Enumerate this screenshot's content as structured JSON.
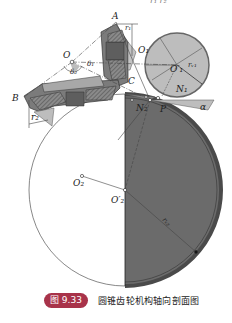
{
  "figure": {
    "type": "bevel-gear-axial-section",
    "top_fragment": "r₁   r₂",
    "labels": {
      "A": "A",
      "B": "B",
      "C": "C",
      "O": "O",
      "O1": "O₁",
      "O1_prime": "O′₁",
      "O2": "O₂",
      "O2_prime": "O′₂",
      "N1": "N₁",
      "N2": "N₂",
      "P": "P",
      "alpha": "α",
      "delta1": "δ₁",
      "delta2": "δ₂",
      "r1": "r₁",
      "r2": "r₂",
      "rv1": "rᵥ₁",
      "rv2": "rᵥ₂"
    },
    "colors": {
      "dark_fill": "#6b6b6b",
      "medium_fill": "#9a9a9a",
      "light_fill": "#c4c4c4",
      "line": "#333333",
      "badge": "#a8334a"
    }
  },
  "caption": {
    "number": "图 9.33",
    "title": "圆锥齿轮机构轴向剖面图"
  }
}
